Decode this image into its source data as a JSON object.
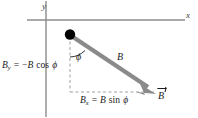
{
  "figure": {
    "background_color": "#ffffff"
  },
  "axes": {
    "x_label": "x",
    "y_label": "y",
    "color": "#8c8c8c",
    "origin": {
      "x": 46,
      "y": 20
    }
  },
  "vector": {
    "magnitude_label": "B",
    "vector_label": "B",
    "color": "#8a8a8a",
    "tail_point": {
      "x": 70,
      "y": 35
    },
    "head_point": {
      "x": 155,
      "y": 92
    },
    "tail_dot_color": "#000000"
  },
  "angle": {
    "symbol": "ϕ",
    "measured_from": "negative y direction",
    "color": "#1a1a1a"
  },
  "components": {
    "y_component": {
      "symbol": "B",
      "subscript": "y",
      "equals": "=",
      "sign": "−",
      "expression_magnitude": "B",
      "trig_function": "cos",
      "angle_symbol": "ϕ",
      "full_text": "B_y = −B cos ϕ"
    },
    "x_component": {
      "symbol": "B",
      "subscript": "x",
      "equals": "=",
      "expression_magnitude": "B",
      "trig_function": "sin",
      "angle_symbol": "ϕ",
      "full_text": "B_x = B sin ϕ"
    }
  },
  "guides": {
    "dash_color": "#a0a0a0",
    "vertical_leg": {
      "x": 70,
      "y_top": 35,
      "y_bottom": 92
    },
    "horizontal_leg": {
      "y": 92,
      "x_left": 70,
      "x_right": 155
    }
  }
}
